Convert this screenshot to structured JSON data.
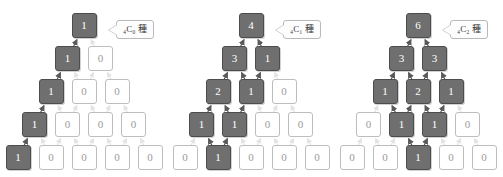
{
  "figure": {
    "cell_on_color": "#6f6f6f",
    "cell_off_color": "#ffffff",
    "arrow_on_color": "#5a5a5a",
    "arrow_off_color": "#e2e2e2"
  },
  "pyramids": [
    {
      "id": "pyramid-c0",
      "left": 0,
      "callout": {
        "text": "₄C₀ 種",
        "prefix": "4",
        "base": "C",
        "sub": "0",
        "suffix": "種"
      },
      "rows": [
        {
          "values": [
            "1"
          ],
          "on": [
            true
          ]
        },
        {
          "values": [
            "1",
            "0"
          ],
          "on": [
            true,
            false
          ]
        },
        {
          "values": [
            "1",
            "0",
            "0"
          ],
          "on": [
            true,
            false,
            false
          ]
        },
        {
          "values": [
            "1",
            "0",
            "0",
            "0"
          ],
          "on": [
            true,
            false,
            false,
            false
          ]
        },
        {
          "values": [
            "1",
            "0",
            "0",
            "0",
            "0"
          ],
          "on": [
            true,
            false,
            false,
            false,
            false
          ]
        }
      ],
      "path": [
        [
          4,
          0
        ],
        [
          3,
          0
        ],
        [
          2,
          0
        ],
        [
          1,
          0
        ],
        [
          0,
          0
        ]
      ]
    },
    {
      "id": "pyramid-c1",
      "left": 167,
      "callout": {
        "text": "₄C₁ 種",
        "prefix": "4",
        "base": "C",
        "sub": "1",
        "suffix": "種"
      },
      "rows": [
        {
          "values": [
            "4"
          ],
          "on": [
            true
          ]
        },
        {
          "values": [
            "3",
            "1"
          ],
          "on": [
            true,
            true
          ]
        },
        {
          "values": [
            "2",
            "1",
            "0"
          ],
          "on": [
            true,
            true,
            false
          ]
        },
        {
          "values": [
            "1",
            "1",
            "0",
            "0"
          ],
          "on": [
            true,
            true,
            false,
            false
          ]
        },
        {
          "values": [
            "0",
            "1",
            "0",
            "0",
            "0"
          ],
          "on": [
            false,
            true,
            false,
            false,
            false
          ]
        }
      ],
      "path": [
        [
          4,
          1
        ],
        [
          3,
          0
        ],
        [
          3,
          1
        ],
        [
          2,
          0
        ],
        [
          2,
          1
        ],
        [
          1,
          0
        ],
        [
          1,
          1
        ],
        [
          0,
          0
        ]
      ]
    },
    {
      "id": "pyramid-c2",
      "left": 334,
      "callout": {
        "text": "₄C₂ 種",
        "prefix": "4",
        "base": "C",
        "sub": "2",
        "suffix": "種"
      },
      "rows": [
        {
          "values": [
            "6"
          ],
          "on": [
            true
          ]
        },
        {
          "values": [
            "3",
            "3"
          ],
          "on": [
            true,
            true
          ]
        },
        {
          "values": [
            "1",
            "2",
            "1"
          ],
          "on": [
            true,
            true,
            true
          ]
        },
        {
          "values": [
            "0",
            "1",
            "1",
            "0"
          ],
          "on": [
            false,
            true,
            true,
            false
          ]
        },
        {
          "values": [
            "0",
            "0",
            "1",
            "0",
            "0"
          ],
          "on": [
            false,
            false,
            true,
            false,
            false
          ]
        }
      ],
      "path": [
        [
          4,
          2
        ],
        [
          3,
          1
        ],
        [
          3,
          2
        ],
        [
          2,
          0
        ],
        [
          2,
          1
        ],
        [
          2,
          2
        ],
        [
          1,
          0
        ],
        [
          1,
          1
        ],
        [
          0,
          0
        ]
      ]
    }
  ],
  "layout": {
    "cell_size": 25,
    "col_step": 33,
    "row_step": 33,
    "top_y": 13,
    "callout_offset_x": 32,
    "callout_offset_y": 3
  }
}
